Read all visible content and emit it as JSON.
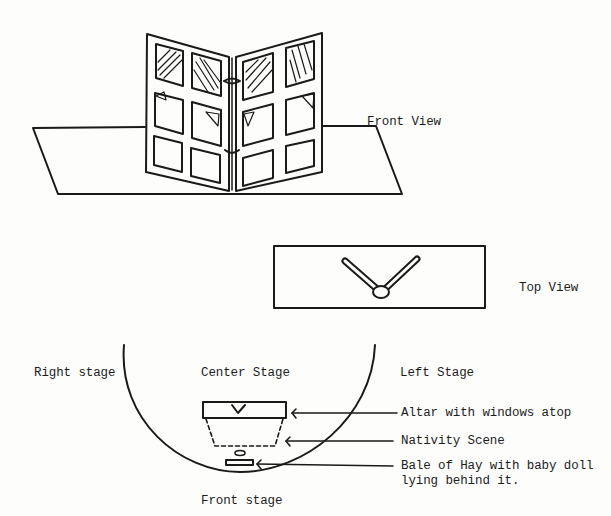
{
  "views": {
    "front_view_label": "Front View",
    "top_view_label": "Top View"
  },
  "stage": {
    "right_stage": "Right stage",
    "center_stage": "Center Stage",
    "left_stage": "Left Stage",
    "front_stage": "Front stage"
  },
  "callouts": [
    {
      "text": "Altar with windows atop"
    },
    {
      "text": "Nativity Scene"
    },
    {
      "text_line1": "Bale of Hay with baby doll",
      "text_line2": "lying behind it."
    }
  ],
  "colors": {
    "ink": "#1a1a1a",
    "paper": "#fdfdfc"
  }
}
